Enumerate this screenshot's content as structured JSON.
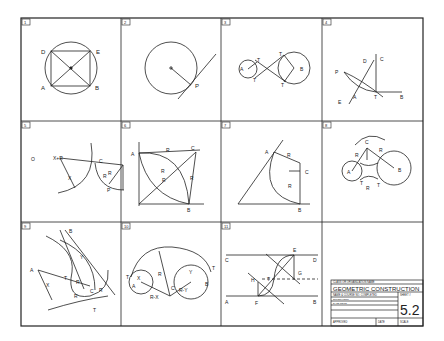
{
  "sheet": {
    "title": "Geometric Construction",
    "panels": [
      {
        "number": "1",
        "labels": [
          "D",
          "E",
          "A",
          "B"
        ]
      },
      {
        "number": "2",
        "labels": [
          "P"
        ]
      },
      {
        "number": "3",
        "labels": [
          "A",
          "B",
          "T",
          "T",
          "T",
          "T"
        ]
      },
      {
        "number": "4",
        "labels": [
          "P",
          "D",
          "C",
          "A",
          "T",
          "B",
          "E"
        ]
      },
      {
        "number": "5",
        "labels": [
          "O",
          "X+R",
          "C",
          "R",
          "R",
          "X",
          "P"
        ]
      },
      {
        "number": "6",
        "labels": [
          "A",
          "R",
          "C",
          "R",
          "R",
          "R",
          "B"
        ]
      },
      {
        "number": "7",
        "labels": [
          "A",
          "R",
          "C",
          "R",
          "B"
        ]
      },
      {
        "number": "8",
        "labels": [
          "C",
          "R",
          "R",
          "A",
          "B",
          "T",
          "T",
          "R"
        ]
      },
      {
        "number": "9",
        "labels": [
          "B",
          "A",
          "Y",
          "X",
          "T",
          "R",
          "C",
          "R",
          "R",
          "T"
        ]
      },
      {
        "number": "10",
        "labels": [
          "T",
          "X",
          "A",
          "R",
          "C",
          "R-X",
          "R-Y",
          "Y",
          "B",
          "T"
        ]
      },
      {
        "number": "11",
        "labels": [
          "C",
          "E",
          "D",
          "T",
          "H",
          "G",
          "A",
          "F",
          "B"
        ]
      }
    ],
    "title_block": {
      "org": "CLASS OR ORGANIZATION NAME",
      "title": "GEOMETRIC CONSTRUCTION",
      "name_row": "NAME & COURSE NO.  COMPLETED",
      "sheet_label": "SHEET #",
      "sheet_number": "5.2",
      "supervisor": "SUPERVISOR",
      "date_row": "DATE REC'D",
      "approved": "APPROVED",
      "date": "DATE",
      "scale": "SCALE"
    }
  }
}
